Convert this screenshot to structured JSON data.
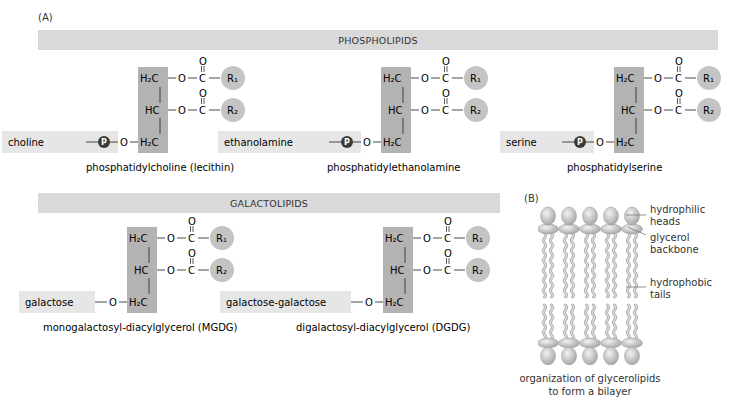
{
  "panel_a_label": "(A)",
  "panel_b_label": "(B)",
  "phospholipids": {
    "header": "PHOSPHOLIPIDS",
    "molecules": [
      {
        "head": "choline",
        "name": "phosphatidylcholine (lecithin)"
      },
      {
        "head": "ethanolamine",
        "name": "phosphatidylethanolamine"
      },
      {
        "head": "serine",
        "name": "phosphatidylserine"
      }
    ]
  },
  "galactolipids": {
    "header": "GALACTOLIPIDS",
    "molecules": [
      {
        "head": "galactose",
        "name": "monogalactosyl-diacylglycerol (MGDG)"
      },
      {
        "head": "galactose-galactose",
        "name": "digalactosyl-diacylglycerol (DGDG)"
      }
    ]
  },
  "atoms": {
    "h2c": "H₂C",
    "hc": "HC",
    "o": "O",
    "c": "C",
    "r1": "R₁",
    "r2": "R₂",
    "p": "P"
  },
  "bilayer": {
    "labels": {
      "heads_1": "hydrophilic",
      "heads_2": "heads",
      "glycerol_1": "glycerol",
      "glycerol_2": "backbone",
      "tails_1": "hydrophobic",
      "tails_2": "tails"
    },
    "caption_1": "organization of glycerolipids",
    "caption_2": "to form a bilayer",
    "lipid_count_per_leaflet": 5
  },
  "colors": {
    "header_bar": "#d9d9d9",
    "backbone_box": "#b3b3b3",
    "head_box": "#e6e6e6",
    "r_circle": "#c4c4c4",
    "p_circle": "#3a3a3a",
    "text": "#333333"
  }
}
